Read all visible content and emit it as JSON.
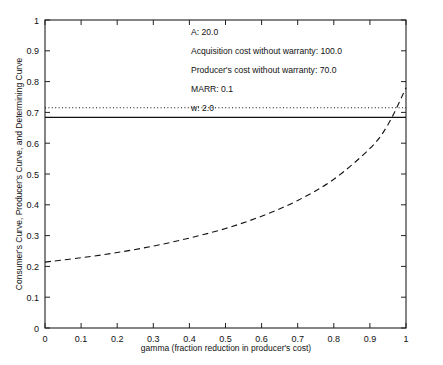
{
  "chart_data": {
    "type": "line",
    "title": "",
    "xlabel": "gamma (fraction reduction in producer's cost)",
    "ylabel": "Consumer's Curve, Producer's Curve, and Determining Curve",
    "xlim": [
      0,
      1
    ],
    "ylim": [
      0,
      1
    ],
    "grid": false,
    "legend_position": "none",
    "xticks": [
      "0",
      "0.1",
      "0.2",
      "0.3",
      "0.4",
      "0.5",
      "0.6",
      "0.7",
      "0.8",
      "0.9",
      "1"
    ],
    "yticks": [
      "0",
      "0.1",
      "0.2",
      "0.3",
      "0.4",
      "0.5",
      "0.6",
      "0.7",
      "0.8",
      "0.9",
      "1"
    ],
    "xtick_values": [
      0,
      0.1,
      0.2,
      0.3,
      0.4,
      0.5,
      0.6,
      0.7,
      0.8,
      0.9,
      1
    ],
    "ytick_values": [
      0,
      0.1,
      0.2,
      0.3,
      0.4,
      0.5,
      0.6,
      0.7,
      0.8,
      0.9,
      1
    ],
    "series": [
      {
        "name": "Consumer's Curve",
        "style": "dotted",
        "color": "#111111",
        "x": [
          0,
          1
        ],
        "values": [
          0.715,
          0.715
        ]
      },
      {
        "name": "Producer's Curve",
        "style": "solid",
        "color": "#111111",
        "x": [
          0,
          1
        ],
        "values": [
          0.684,
          0.684
        ]
      },
      {
        "name": "Determining Curve",
        "style": "dashed",
        "color": "#111111",
        "x": [
          0,
          0.1,
          0.2,
          0.3,
          0.4,
          0.5,
          0.6,
          0.7,
          0.8,
          0.9,
          0.95,
          1
        ],
        "values": [
          0.214,
          0.228,
          0.245,
          0.266,
          0.292,
          0.323,
          0.363,
          0.414,
          0.483,
          0.583,
          0.66,
          0.78
        ]
      }
    ],
    "annotations": [
      {
        "id": "param-a",
        "text": "A: 20.0"
      },
      {
        "id": "param-acquisition-cost",
        "text": "Acquisition cost without warranty: 100.0"
      },
      {
        "id": "param-producer-cost",
        "text": "Producer's cost without warranty: 70.0"
      },
      {
        "id": "param-marr",
        "text": "MARR: 0.1"
      },
      {
        "id": "param-w",
        "text": "w: 2.0"
      }
    ]
  },
  "axes": {
    "x_title": "gamma (fraction reduction in producer's cost)",
    "y_title": "Consumer's Curve, Producer's Curve, and Determining Curve",
    "x_labels": [
      "0",
      "0.1",
      "0.2",
      "0.3",
      "0.4",
      "0.5",
      "0.6",
      "0.7",
      "0.8",
      "0.9",
      "1"
    ],
    "y_labels": [
      "0",
      "0.1",
      "0.2",
      "0.3",
      "0.4",
      "0.5",
      "0.6",
      "0.7",
      "0.8",
      "0.9",
      "1"
    ]
  },
  "annotation_lines": {
    "line1": "A: 20.0",
    "line2": "Acquisition cost without warranty: 100.0",
    "line3": "Producer's cost without warranty: 70.0",
    "line4": "MARR: 0.1",
    "line5": "w: 2.0"
  },
  "colors": {
    "axis": "#111111",
    "curve": "#111111",
    "background": "#ffffff"
  }
}
